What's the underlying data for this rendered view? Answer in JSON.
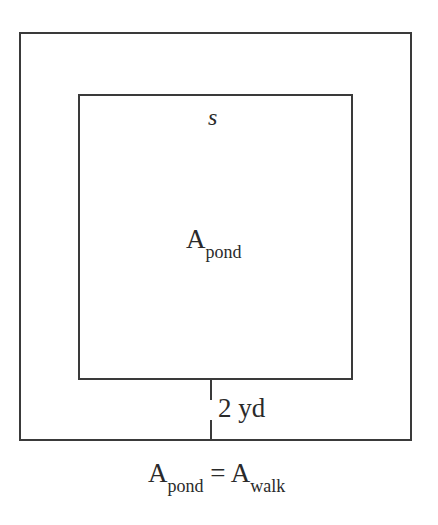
{
  "diagram": {
    "inner_side_label": "s",
    "pond_label": {
      "main": "A",
      "sub": "pond"
    },
    "walk_width_label": "2 yd",
    "equation": {
      "left_main": "A",
      "left_sub": "pond",
      "operator": "=",
      "right_main": "A",
      "right_sub": "walk"
    }
  }
}
